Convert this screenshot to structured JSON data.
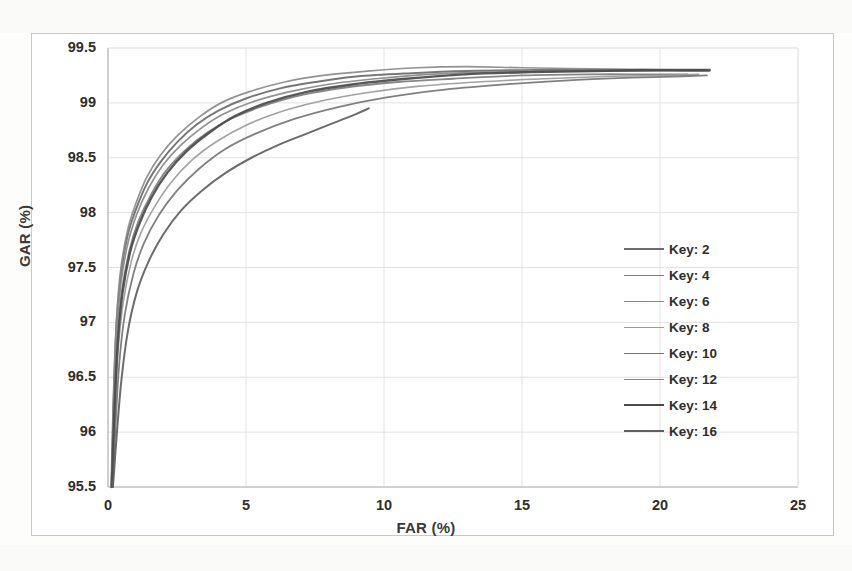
{
  "chart_data": {
    "type": "line",
    "title": "",
    "xlabel": "FAR (%)",
    "ylabel": "GAR (%)",
    "xlim": [
      0,
      25
    ],
    "ylim": [
      95.5,
      99.5
    ],
    "xticks": [
      "0",
      "5",
      "10",
      "15",
      "20",
      "25"
    ],
    "yticks": [
      "95.5",
      "96",
      "96.5",
      "97",
      "97.5",
      "98",
      "98.5",
      "99",
      "99.5"
    ],
    "grid": true,
    "legend_position": "right",
    "legend_entries": [
      "Key: 2",
      "Key: 4",
      "Key: 6",
      "Key: 8",
      "Key: 10",
      "Key: 12",
      "Key: 14",
      "Key: 16"
    ],
    "series": [
      {
        "name": "Key: 2",
        "color": "#6b6b6b",
        "width": 2.0,
        "points": [
          [
            0.12,
            95.5
          ],
          [
            0.2,
            96.3
          ],
          [
            0.3,
            96.95
          ],
          [
            0.45,
            97.4
          ],
          [
            0.7,
            97.78
          ],
          [
            1.0,
            98.02
          ],
          [
            1.4,
            98.26
          ],
          [
            1.9,
            98.46
          ],
          [
            2.5,
            98.64
          ],
          [
            3.2,
            98.8
          ],
          [
            4.0,
            98.93
          ],
          [
            5.0,
            99.04
          ],
          [
            6.2,
            99.13
          ],
          [
            7.5,
            99.19
          ],
          [
            9.0,
            99.24
          ],
          [
            11.0,
            99.27
          ],
          [
            13.0,
            99.29
          ],
          [
            15.5,
            99.3
          ],
          [
            18.0,
            99.3
          ],
          [
            20.0,
            99.3
          ],
          [
            21.6,
            99.3
          ]
        ]
      },
      {
        "name": "Key: 4",
        "color": "#7d7d7d",
        "width": 1.8,
        "points": [
          [
            0.14,
            95.5
          ],
          [
            0.22,
            96.2
          ],
          [
            0.34,
            96.82
          ],
          [
            0.5,
            97.28
          ],
          [
            0.78,
            97.66
          ],
          [
            1.1,
            97.92
          ],
          [
            1.55,
            98.16
          ],
          [
            2.1,
            98.38
          ],
          [
            2.8,
            98.57
          ],
          [
            3.6,
            98.73
          ],
          [
            4.5,
            98.86
          ],
          [
            5.6,
            98.97
          ],
          [
            7.0,
            99.07
          ],
          [
            8.6,
            99.14
          ],
          [
            10.5,
            99.19
          ],
          [
            12.5,
            99.22
          ],
          [
            15.0,
            99.25
          ],
          [
            17.5,
            99.26
          ],
          [
            19.5,
            99.26
          ],
          [
            21.0,
            99.26
          ]
        ]
      },
      {
        "name": "Key: 6",
        "color": "#8a8a8a",
        "width": 1.7,
        "points": [
          [
            0.13,
            95.5
          ],
          [
            0.21,
            96.36
          ],
          [
            0.31,
            97.02
          ],
          [
            0.46,
            97.48
          ],
          [
            0.72,
            97.85
          ],
          [
            1.02,
            98.09
          ],
          [
            1.42,
            98.33
          ],
          [
            1.92,
            98.53
          ],
          [
            2.55,
            98.71
          ],
          [
            3.3,
            98.87
          ],
          [
            4.1,
            99.0
          ],
          [
            5.1,
            99.1
          ],
          [
            6.4,
            99.19
          ],
          [
            7.8,
            99.25
          ],
          [
            9.4,
            99.29
          ],
          [
            11.2,
            99.32
          ],
          [
            13.0,
            99.33
          ],
          [
            15.0,
            99.32
          ],
          [
            17.5,
            99.31
          ],
          [
            20.0,
            99.3
          ],
          [
            21.8,
            99.29
          ]
        ]
      },
      {
        "name": "Key: 8",
        "color": "#9a9a9a",
        "width": 1.6,
        "points": [
          [
            0.15,
            95.5
          ],
          [
            0.24,
            96.1
          ],
          [
            0.36,
            96.72
          ],
          [
            0.55,
            97.18
          ],
          [
            0.85,
            97.56
          ],
          [
            1.2,
            97.82
          ],
          [
            1.7,
            98.06
          ],
          [
            2.3,
            98.28
          ],
          [
            3.05,
            98.48
          ],
          [
            3.95,
            98.65
          ],
          [
            4.95,
            98.79
          ],
          [
            6.15,
            98.91
          ],
          [
            7.6,
            99.01
          ],
          [
            9.3,
            99.09
          ],
          [
            11.2,
            99.15
          ],
          [
            13.4,
            99.19
          ],
          [
            15.8,
            99.22
          ],
          [
            18.0,
            99.24
          ],
          [
            20.0,
            99.25
          ],
          [
            21.4,
            99.26
          ]
        ]
      },
      {
        "name": "Key: 10",
        "color": "#757575",
        "width": 1.8,
        "points": [
          [
            0.16,
            95.5
          ],
          [
            0.26,
            96.0
          ],
          [
            0.4,
            96.6
          ],
          [
            0.6,
            97.06
          ],
          [
            0.92,
            97.44
          ],
          [
            1.3,
            97.72
          ],
          [
            1.85,
            97.98
          ],
          [
            2.5,
            98.2
          ],
          [
            3.3,
            98.4
          ],
          [
            4.25,
            98.58
          ],
          [
            5.35,
            98.72
          ],
          [
            6.7,
            98.85
          ],
          [
            8.3,
            98.96
          ],
          [
            10.1,
            99.05
          ],
          [
            12.2,
            99.12
          ],
          [
            14.5,
            99.17
          ],
          [
            17.0,
            99.21
          ],
          [
            19.0,
            99.23
          ],
          [
            20.5,
            99.24
          ],
          [
            21.7,
            99.25
          ]
        ]
      },
      {
        "name": "Key: 12",
        "color": "#888888",
        "width": 1.7,
        "points": [
          [
            0.13,
            95.5
          ],
          [
            0.21,
            96.28
          ],
          [
            0.32,
            96.9
          ],
          [
            0.47,
            97.36
          ],
          [
            0.74,
            97.74
          ],
          [
            1.05,
            97.99
          ],
          [
            1.46,
            98.22
          ],
          [
            1.98,
            98.43
          ],
          [
            2.62,
            98.61
          ],
          [
            3.38,
            98.77
          ],
          [
            4.2,
            98.9
          ],
          [
            5.25,
            99.01
          ],
          [
            6.55,
            99.1
          ],
          [
            8.0,
            99.17
          ],
          [
            9.7,
            99.22
          ],
          [
            11.6,
            99.26
          ],
          [
            13.8,
            99.28
          ],
          [
            16.2,
            99.29
          ],
          [
            18.5,
            99.29
          ],
          [
            20.5,
            99.29
          ],
          [
            21.7,
            99.29
          ]
        ]
      },
      {
        "name": "Key: 14",
        "color": "#4a4a4a",
        "width": 2.4,
        "points": [
          [
            0.14,
            95.5
          ],
          [
            0.23,
            96.18
          ],
          [
            0.35,
            96.8
          ],
          [
            0.52,
            97.26
          ],
          [
            0.8,
            97.64
          ],
          [
            1.14,
            97.9
          ],
          [
            1.58,
            98.14
          ],
          [
            2.14,
            98.36
          ],
          [
            2.85,
            98.56
          ],
          [
            3.68,
            98.73
          ],
          [
            4.6,
            98.88
          ],
          [
            5.75,
            99.0
          ],
          [
            7.2,
            99.1
          ],
          [
            8.9,
            99.17
          ],
          [
            10.8,
            99.22
          ],
          [
            12.9,
            99.26
          ],
          [
            15.3,
            99.28
          ],
          [
            17.6,
            99.29
          ],
          [
            19.4,
            99.3
          ],
          [
            20.8,
            99.3
          ],
          [
            21.8,
            99.3
          ]
        ]
      },
      {
        "name": "Key: 16",
        "color": "#5f5f5f",
        "width": 2.0,
        "points": [
          [
            0.18,
            95.5
          ],
          [
            0.3,
            95.92
          ],
          [
            0.48,
            96.46
          ],
          [
            0.72,
            96.92
          ],
          [
            1.05,
            97.28
          ],
          [
            1.48,
            97.56
          ],
          [
            2.0,
            97.8
          ],
          [
            2.65,
            98.02
          ],
          [
            3.4,
            98.2
          ],
          [
            4.25,
            98.36
          ],
          [
            5.2,
            98.5
          ],
          [
            6.2,
            98.62
          ],
          [
            7.2,
            98.72
          ],
          [
            8.2,
            98.82
          ],
          [
            9.0,
            98.9
          ],
          [
            9.45,
            98.95
          ]
        ]
      }
    ]
  },
  "axis": {
    "y_title": "GAR (%)",
    "x_title": "FAR (%)"
  },
  "legend": {
    "items": [
      {
        "label": "Key: 2",
        "color": "#6b6b6b",
        "width": 2.0
      },
      {
        "label": "Key: 4",
        "color": "#7d7d7d",
        "width": 1.8
      },
      {
        "label": "Key: 6",
        "color": "#8a8a8a",
        "width": 1.7
      },
      {
        "label": "Key: 8",
        "color": "#9a9a9a",
        "width": 1.6
      },
      {
        "label": "Key: 10",
        "color": "#757575",
        "width": 1.8
      },
      {
        "label": "Key: 12",
        "color": "#888888",
        "width": 1.7
      },
      {
        "label": "Key: 14",
        "color": "#4a4a4a",
        "width": 2.4
      },
      {
        "label": "Key: 16",
        "color": "#5f5f5f",
        "width": 2.0
      }
    ]
  },
  "colors": {
    "background": "#ffffff",
    "grid": "#e2e2e0",
    "axis_line": "#c8c8c6",
    "text": "#2e2e2c"
  }
}
